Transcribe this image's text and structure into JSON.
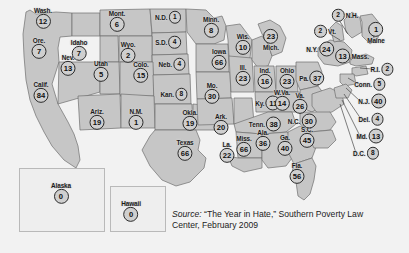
{
  "figure": {
    "kind": "choropleth-map",
    "region": "United States",
    "background_color": "#f2f2f2",
    "land_color": "#c6c6c6",
    "water_color": "#f2f2f2",
    "outline_color": "#6e6e6e",
    "bubble_fill": "#cfcfcf",
    "bubble_stroke": "#2b2b2b"
  },
  "source_note": {
    "label": "Source:",
    "text": "“The Year in Hate,” Southern Poverty Law Center, February 2009"
  },
  "insets": [
    {
      "name": "Alaska",
      "value": "0"
    },
    {
      "name": "Hawaii",
      "value": "0"
    }
  ],
  "chart_data": {
    "type": "map",
    "title": "",
    "value_label": "Number of hate groups",
    "categories": [
      "Wash.",
      "Ore.",
      "Idaho",
      "Mont.",
      "Wyo.",
      "Nev.",
      "Utah",
      "Colo.",
      "Calif.",
      "Ariz.",
      "N.M.",
      "N.D.",
      "S.D.",
      "Neb.",
      "Kan.",
      "Okla.",
      "Texas",
      "Minn.",
      "Iowa",
      "Mo.",
      "Ark.",
      "La.",
      "Miss.",
      "Wis.",
      "Ill.",
      "Mich.",
      "Ind.",
      "Ohio",
      "Ky.",
      "Tenn.",
      "Ala.",
      "Ga.",
      "Fla.",
      "S.C.",
      "N.C.",
      "Va.",
      "W.Va.",
      "Pa.",
      "N.Y.",
      "Vt.",
      "N.H.",
      "Maine",
      "Mass.",
      "R.I.",
      "Conn.",
      "N.J.",
      "Del.",
      "Md.",
      "D.C.",
      "Alaska",
      "Hawaii"
    ],
    "values": [
      12,
      7,
      7,
      6,
      2,
      13,
      5,
      15,
      84,
      19,
      1,
      1,
      4,
      4,
      8,
      19,
      66,
      8,
      66,
      30,
      20,
      22,
      66,
      10,
      23,
      23,
      16,
      23,
      11,
      38,
      36,
      40,
      56,
      45,
      30,
      26,
      14,
      37,
      24,
      2,
      2,
      1,
      13,
      2,
      5,
      40,
      4,
      13,
      8,
      0,
      0
    ]
  },
  "states": [
    {
      "name": "Wash.",
      "value": "12",
      "x": 43,
      "y": 18,
      "layout": "stacked"
    },
    {
      "name": "Ore.",
      "y": 48,
      "x": 39,
      "value": "7",
      "layout": "stacked"
    },
    {
      "name": "Idaho",
      "value": "7",
      "x": 79,
      "y": 50,
      "layout": "stacked"
    },
    {
      "name": "Mont.",
      "value": "6",
      "x": 117,
      "y": 21,
      "layout": "stacked"
    },
    {
      "name": "Wyo.",
      "value": "2",
      "x": 128,
      "y": 52,
      "layout": "stacked"
    },
    {
      "name": "Nev.",
      "value": "13",
      "x": 68,
      "y": 65,
      "layout": "stacked"
    },
    {
      "name": "Utah",
      "value": "5",
      "x": 101,
      "y": 71,
      "layout": "stacked"
    },
    {
      "name": "Colo.",
      "value": "15",
      "x": 141,
      "y": 72,
      "layout": "stacked"
    },
    {
      "name": "Calif.",
      "value": "84",
      "x": 41,
      "y": 92,
      "layout": "stacked"
    },
    {
      "name": "Ariz.",
      "value": "19",
      "x": 97,
      "y": 119,
      "layout": "stacked"
    },
    {
      "name": "N.M.",
      "value": "1",
      "x": 136,
      "y": 119,
      "layout": "stacked"
    },
    {
      "name": "N.D.",
      "value": "1",
      "x": 168,
      "y": 17,
      "layout": "inline"
    },
    {
      "name": "S.D.",
      "value": "4",
      "x": 168,
      "y": 42,
      "layout": "inline"
    },
    {
      "name": "Neb.",
      "value": "4",
      "x": 172,
      "y": 64,
      "layout": "inline"
    },
    {
      "name": "Kan.",
      "value": "8",
      "x": 174,
      "y": 94,
      "layout": "inline"
    },
    {
      "name": "Okla.",
      "value": "19",
      "x": 190,
      "y": 120,
      "layout": "stacked"
    },
    {
      "name": "Texas",
      "value": "66",
      "x": 185,
      "y": 150,
      "layout": "stacked"
    },
    {
      "name": "Minn.",
      "value": "8",
      "x": 211,
      "y": 27,
      "layout": "stacked"
    },
    {
      "name": "Iowa",
      "value": "66",
      "x": 219,
      "y": 59,
      "layout": "stacked"
    },
    {
      "name": "Mo.",
      "value": "30",
      "x": 212,
      "y": 93,
      "layout": "stacked"
    },
    {
      "name": "Ark.",
      "value": "20",
      "x": 221,
      "y": 124,
      "layout": "stacked"
    },
    {
      "name": "La.",
      "value": "22",
      "x": 227,
      "y": 152,
      "layout": "stacked"
    },
    {
      "name": "Miss.",
      "value": "66",
      "x": 244,
      "y": 146,
      "layout": "stacked"
    },
    {
      "name": "Wis.",
      "value": "10",
      "x": 243,
      "y": 44,
      "layout": "stacked"
    },
    {
      "name": "Ill.",
      "value": "23",
      "x": 243,
      "y": 75,
      "layout": "stacked"
    },
    {
      "name": "Mich.",
      "value": "23",
      "x": 271,
      "y": 40,
      "layout": "bubble-above"
    },
    {
      "name": "Ind.",
      "value": "16",
      "x": 265,
      "y": 78,
      "layout": "stacked"
    },
    {
      "name": "Ohio",
      "value": "23",
      "x": 287,
      "y": 78,
      "layout": "stacked"
    },
    {
      "name": "Ky.",
      "value": "11",
      "x": 268,
      "y": 103,
      "layout": "inline"
    },
    {
      "name": "Tenn.",
      "value": "38",
      "x": 265,
      "y": 124,
      "layout": "inline"
    },
    {
      "name": "Ala.",
      "value": "36",
      "x": 263,
      "y": 140,
      "layout": "stacked"
    },
    {
      "name": "Ga.",
      "value": "40",
      "x": 285,
      "y": 145,
      "layout": "stacked"
    },
    {
      "name": "Fla.",
      "value": "56",
      "x": 297,
      "y": 173,
      "layout": "stacked"
    },
    {
      "name": "S.C.",
      "value": "45",
      "x": 307,
      "y": 137,
      "layout": "stacked"
    },
    {
      "name": "N.C.",
      "value": "30",
      "x": 302,
      "y": 121,
      "layout": "inline"
    },
    {
      "name": "Va.",
      "value": "26",
      "x": 300,
      "y": 103,
      "layout": "stacked"
    },
    {
      "name": "W.Va.",
      "value": "14",
      "x": 282,
      "y": 100,
      "layout": "stacked"
    },
    {
      "name": "Pa.",
      "value": "37",
      "x": 312,
      "y": 78,
      "layout": "inline"
    },
    {
      "name": "N.Y.",
      "value": "24",
      "x": 320,
      "y": 49,
      "layout": "inline"
    },
    {
      "name": "Vt.",
      "value": "2",
      "x": 325,
      "y": 31,
      "layout": "bubble-left"
    },
    {
      "name": "N.H.",
      "value": "2",
      "x": 345,
      "y": 15,
      "layout": "bubble-left"
    },
    {
      "name": "Maine",
      "value": "1",
      "x": 376,
      "y": 33,
      "layout": "bubble-above"
    },
    {
      "name": "Mass.",
      "value": "13",
      "x": 352,
      "y": 56,
      "layout": "bubble-left-label-right"
    },
    {
      "name": "R.I.",
      "value": "2",
      "x": 382,
      "y": 69,
      "layout": "inline"
    },
    {
      "name": "Conn.",
      "value": "5",
      "x": 370,
      "y": 84,
      "layout": "inline"
    },
    {
      "name": "N.J.",
      "value": "40",
      "x": 372,
      "y": 101,
      "layout": "inline"
    },
    {
      "name": "Del.",
      "value": "4",
      "x": 371,
      "y": 119,
      "layout": "inline"
    },
    {
      "name": "Md.",
      "value": "13",
      "x": 370,
      "y": 136,
      "layout": "inline"
    },
    {
      "name": "D.C.",
      "value": "8",
      "x": 366,
      "y": 153,
      "layout": "inline"
    }
  ]
}
